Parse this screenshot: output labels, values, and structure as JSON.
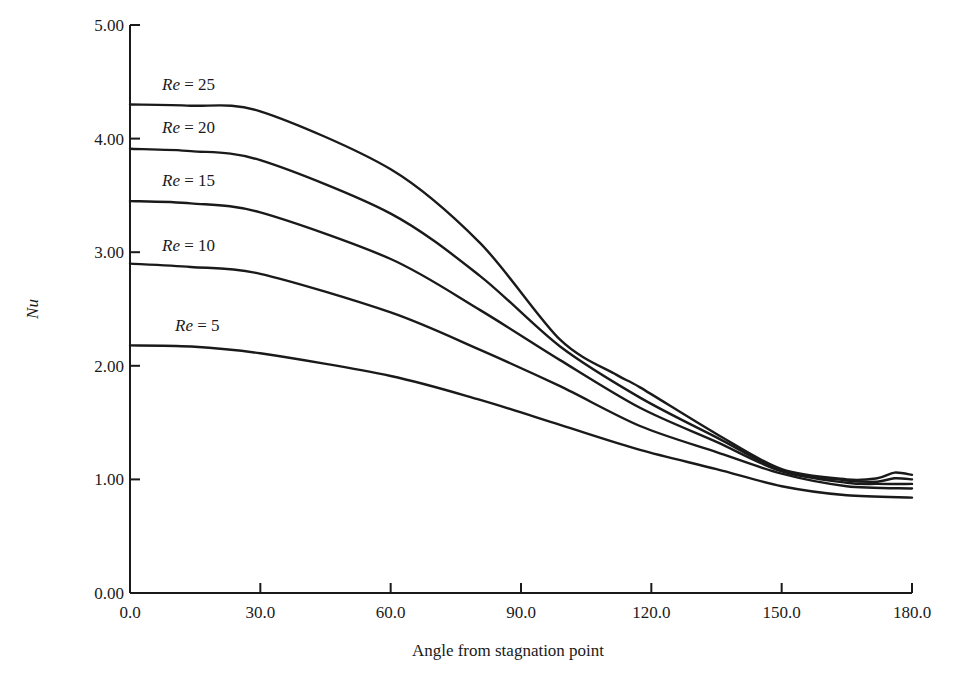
{
  "chart_data": {
    "type": "line",
    "title": "",
    "xlabel": "Angle from stagnation point",
    "ylabel": "Nu",
    "xlim": [
      0,
      180
    ],
    "ylim": [
      0,
      5
    ],
    "grid": false,
    "legend": "inline labels above each curve",
    "x_ticks": [
      "0.0",
      "30.0",
      "60.0",
      "90.0",
      "120.0",
      "150.0",
      "180.0"
    ],
    "y_ticks": [
      "0.00",
      "1.00",
      "2.00",
      "3.00",
      "4.00",
      "5.00"
    ],
    "series": [
      {
        "name": "Re = 25",
        "re_prefix": "Re",
        "re_value": "= 25",
        "label_pos": [
          0,
          4.43
        ],
        "x": [
          0,
          14,
          30,
          60,
          80.6,
          99,
          112,
          117.4,
          135,
          150,
          165,
          172,
          176,
          180
        ],
        "values": [
          4.3,
          4.29,
          4.24,
          3.73,
          3.08,
          2.23,
          1.92,
          1.81,
          1.4,
          1.09,
          1.0,
          1.01,
          1.06,
          1.04
        ]
      },
      {
        "name": "Re = 20",
        "re_prefix": "Re",
        "re_value": "= 20",
        "label_pos": [
          0,
          4.05
        ],
        "x": [
          0,
          14,
          30,
          60,
          80.6,
          99,
          117.4,
          135,
          150,
          165,
          172,
          176,
          180
        ],
        "values": [
          3.91,
          3.89,
          3.81,
          3.34,
          2.79,
          2.17,
          1.72,
          1.37,
          1.08,
          0.99,
          0.98,
          1.01,
          1.0
        ]
      },
      {
        "name": "Re = 15",
        "re_prefix": "Re",
        "re_value": "= 15",
        "label_pos": [
          0,
          3.58
        ],
        "x": [
          0,
          14,
          30,
          60,
          80.6,
          99,
          117.4,
          135,
          150,
          165,
          172,
          180
        ],
        "values": [
          3.45,
          3.43,
          3.35,
          2.94,
          2.49,
          2.05,
          1.63,
          1.33,
          1.07,
          0.97,
          0.96,
          0.96
        ]
      },
      {
        "name": "Re = 10",
        "re_prefix": "Re",
        "re_value": "= 10",
        "label_pos": [
          0,
          3.01
        ],
        "x": [
          0,
          14,
          30,
          60,
          80.6,
          99,
          117.4,
          135,
          150,
          165,
          180
        ],
        "values": [
          2.9,
          2.87,
          2.81,
          2.47,
          2.14,
          1.82,
          1.47,
          1.24,
          1.05,
          0.94,
          0.92
        ]
      },
      {
        "name": "Re = 5",
        "re_prefix": "Re",
        "re_value": "= 5",
        "label_pos": [
          3,
          2.31
        ],
        "x": [
          0,
          14,
          30,
          60,
          80.6,
          99,
          117.4,
          135,
          150,
          165,
          180
        ],
        "values": [
          2.18,
          2.17,
          2.11,
          1.91,
          1.7,
          1.48,
          1.26,
          1.09,
          0.94,
          0.86,
          0.84
        ]
      }
    ]
  }
}
